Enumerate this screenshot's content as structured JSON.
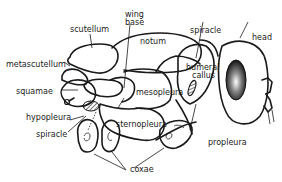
{
  "diagram": {
    "labels": {
      "scutellum": "scutellum",
      "wing_base": [
        "wing",
        "base"
      ],
      "notum": "notum",
      "spiracle_top": "spiracle",
      "head": "head",
      "metascutellum": "metascutellum",
      "humeral_callus": [
        "humeral",
        "callus"
      ],
      "squamae": "squamae",
      "mesopleura": "mesopleura",
      "hypopleura": "hypopleura",
      "sternopleura": "sternopleura",
      "spiracle_bottom": "spiracle",
      "propleura": "propleura",
      "coxae": "coxae"
    },
    "colors": {
      "ink": "#1a1a1a",
      "background": "#ffffff"
    }
  }
}
